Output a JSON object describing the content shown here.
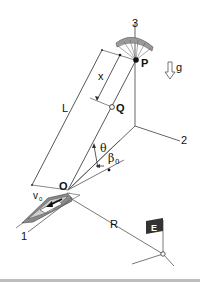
{
  "diagram": {
    "labels": {
      "axis_1": "1",
      "axis_2": "2",
      "axis_3": "3",
      "point_P": "P",
      "point_Q": "Q",
      "point_O": "O",
      "length_L": "L",
      "distance_x": "x",
      "gravity": "g",
      "angle_theta": "θ",
      "angle_beta": "β",
      "angle_beta_sub": "0",
      "velocity_v": "v",
      "velocity_sub": "0",
      "radius_R": "R",
      "flag_E": "E"
    },
    "icons": {
      "parasail": "parasail-canopy-icon",
      "boat": "motorboat-icon",
      "flag": "flag-icon",
      "gravity_arrow": "down-arrow-icon"
    },
    "colors": {
      "line": "#555555",
      "text": "#111111",
      "flag": "#333333",
      "canopy": "#9a9a9a",
      "boat_hull": "#8a8a8a",
      "bottom_rule": "#bdbdbd"
    }
  }
}
